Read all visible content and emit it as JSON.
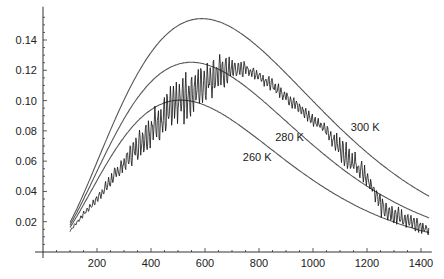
{
  "chart_data": {
    "type": "line",
    "title": "",
    "xlabel": "",
    "ylabel": "",
    "xlim": [
      0,
      1440
    ],
    "ylim": [
      0,
      0.16
    ],
    "grid": false,
    "x_ticks": [
      200,
      400,
      600,
      800,
      1000,
      1200,
      1400
    ],
    "x_tick_labels": [
      "200",
      "400",
      "600",
      "800",
      "1000",
      "1200",
      "1400"
    ],
    "y_ticks": [
      0.02,
      0.04,
      0.06,
      0.08,
      0.1,
      0.12,
      0.14
    ],
    "y_tick_labels": [
      "0.02",
      "0.04",
      "0.06",
      "0.08",
      "0.10",
      "0.12",
      "0.14"
    ],
    "series": [
      {
        "name": "300 K",
        "kind": "planck",
        "temperature": 300,
        "x": [
          100,
          200,
          300,
          400,
          500,
          600,
          700,
          800,
          900,
          1000,
          1100,
          1200,
          1300,
          1430
        ],
        "values": [
          0.019,
          0.054,
          0.092,
          0.124,
          0.146,
          0.154,
          0.15,
          0.138,
          0.121,
          0.103,
          0.085,
          0.068,
          0.054,
          0.039
        ],
        "label_pos": {
          "x": 1140,
          "y": 0.08
        }
      },
      {
        "name": "280 K",
        "kind": "planck",
        "temperature": 280,
        "x": [
          100,
          200,
          300,
          400,
          500,
          600,
          700,
          800,
          900,
          1000,
          1100,
          1200,
          1300,
          1430
        ],
        "values": [
          0.018,
          0.049,
          0.081,
          0.107,
          0.122,
          0.125,
          0.119,
          0.106,
          0.09,
          0.074,
          0.059,
          0.046,
          0.035,
          0.024
        ],
        "label_pos": {
          "x": 860,
          "y": 0.073
        }
      },
      {
        "name": "260 K",
        "kind": "planck",
        "temperature": 260,
        "x": [
          100,
          200,
          300,
          400,
          500,
          600,
          700,
          800,
          900,
          1000,
          1100,
          1200,
          1300,
          1430
        ],
        "values": [
          0.016,
          0.044,
          0.071,
          0.09,
          0.1,
          0.099,
          0.091,
          0.079,
          0.065,
          0.052,
          0.04,
          0.03,
          0.022,
          0.014
        ],
        "label_pos": {
          "x": 740,
          "y": 0.06
        }
      },
      {
        "name": "measured spectrum",
        "kind": "measured",
        "x": [
          100,
          150,
          200,
          250,
          300,
          350,
          400,
          450,
          500,
          550,
          600,
          650,
          700,
          750,
          800,
          850,
          900,
          950,
          1000,
          1050,
          1100,
          1150,
          1200,
          1250,
          1300,
          1350,
          1400,
          1430
        ],
        "upper": [
          0.015,
          0.027,
          0.038,
          0.052,
          0.065,
          0.08,
          0.094,
          0.106,
          0.116,
          0.122,
          0.127,
          0.132,
          0.131,
          0.126,
          0.121,
          0.115,
          0.108,
          0.1,
          0.092,
          0.085,
          0.077,
          0.068,
          0.058,
          0.04,
          0.032,
          0.026,
          0.021,
          0.018
        ],
        "lower": [
          0.013,
          0.023,
          0.032,
          0.042,
          0.052,
          0.06,
          0.068,
          0.074,
          0.08,
          0.088,
          0.098,
          0.104,
          0.11,
          0.116,
          0.112,
          0.105,
          0.098,
          0.09,
          0.083,
          0.075,
          0.06,
          0.05,
          0.04,
          0.022,
          0.018,
          0.015,
          0.012,
          0.01
        ]
      }
    ]
  }
}
